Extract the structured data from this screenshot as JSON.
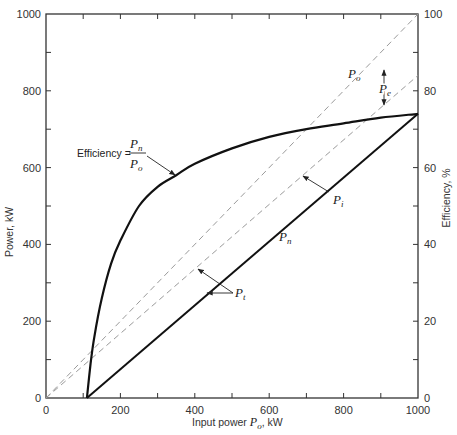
{
  "chart_data": {
    "type": "line",
    "title": "",
    "xlabel": "Input power P_o, kW",
    "ylabel": "Power, kW",
    "ylabel_right": "Efficiency, %",
    "xlim": [
      0,
      1000
    ],
    "ylim": [
      0,
      1000
    ],
    "ylim_right": [
      0,
      100
    ],
    "grid": false,
    "x_ticks": [
      0,
      200,
      400,
      600,
      800,
      1000
    ],
    "y_ticks": [
      0,
      200,
      400,
      600,
      800,
      1000
    ],
    "y_ticks_right": [
      0,
      20,
      40,
      60,
      80,
      100
    ],
    "series": [
      {
        "name": "P_o",
        "style": "dashed",
        "axis": "left",
        "x": [
          0,
          1000
        ],
        "y": [
          0,
          1000
        ]
      },
      {
        "name": "P_i",
        "style": "dashed",
        "axis": "left",
        "x": [
          0,
          1000
        ],
        "y": [
          0,
          840
        ]
      },
      {
        "name": "P_n",
        "style": "solid",
        "axis": "left",
        "x": [
          110,
          1000
        ],
        "y": [
          0,
          740
        ]
      },
      {
        "name": "Efficiency = P_n / P_o",
        "style": "solid",
        "axis": "right",
        "x": [
          110,
          120,
          130,
          150,
          175,
          200,
          250,
          300,
          350,
          400,
          500,
          600,
          700,
          800,
          900,
          1000
        ],
        "y": [
          0,
          9,
          16,
          26,
          35,
          41,
          50,
          55,
          58,
          61,
          65,
          68,
          70,
          71.5,
          73,
          74
        ]
      }
    ],
    "annotations": [
      {
        "text": "Efficiency = P_n / P_o",
        "points_to": [
          350,
          57
        ]
      },
      {
        "text": "P_o",
        "near": [
          760,
          900
        ]
      },
      {
        "text": "P_e",
        "note": "double arrow between P_o and P_i lines at x≈900"
      },
      {
        "text": "P_i",
        "points_to": [
          670,
          560
        ]
      },
      {
        "text": "P_n",
        "near": [
          620,
          470
        ]
      },
      {
        "text": "P_t",
        "points_to": [
          [
            410,
            340
          ],
          [
            440,
            275
          ]
        ]
      }
    ]
  },
  "labels": {
    "x_ticks": [
      "0",
      "200",
      "400",
      "600",
      "800",
      "1000"
    ],
    "y_ticks": [
      "0",
      "200",
      "400",
      "600",
      "800",
      "1000"
    ],
    "y_ticks_right": [
      "0",
      "20",
      "40",
      "60",
      "80",
      "100"
    ],
    "xlabel_prefix": "Input power ",
    "xlabel_var": "P",
    "xlabel_sub": "o",
    "xlabel_suffix": ", kW",
    "ylabel": "Power, kW",
    "ylabel_right": "Efficiency, %",
    "eff_prefix": "Efficiency =",
    "eff_num": "P",
    "eff_num_sub": "n",
    "eff_den": "P",
    "eff_den_sub": "o",
    "p": "P",
    "sub_o": "o",
    "sub_e": "e",
    "sub_i": "i",
    "sub_n": "n",
    "sub_t": "t"
  },
  "colors": {
    "frame": "#333333",
    "solid": "#111111",
    "dashed": "#9a9a9a"
  }
}
